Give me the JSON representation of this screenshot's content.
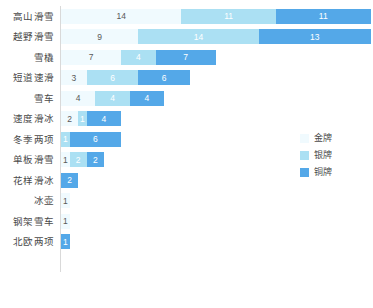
{
  "chart_data": {
    "type": "bar",
    "orientation": "horizontal",
    "stacked": true,
    "title": "",
    "subtitle": "",
    "xlabel": "",
    "ylabel": "",
    "grid": false,
    "xlim": [
      0,
      36
    ],
    "legend_position": "right",
    "categories": [
      "高山滑雪",
      "越野滑雪",
      "雪橇",
      "短道速滑",
      "雪车",
      "速度滑冰",
      "冬季两项",
      "单板滑雪",
      "花样滑冰",
      "冰壶",
      "钢架雪车",
      "北欧两项"
    ],
    "series": [
      {
        "name": "金牌",
        "color": "#f0fafe",
        "values": [
          14,
          9,
          7,
          3,
          4,
          2,
          0,
          1,
          0,
          1,
          1,
          0
        ]
      },
      {
        "name": "银牌",
        "color": "#abe0f3",
        "values": [
          11,
          14,
          4,
          6,
          4,
          1,
          1,
          2,
          0,
          0,
          0,
          0
        ]
      },
      {
        "name": "铜牌",
        "color": "#54a8e8",
        "values": [
          11,
          13,
          7,
          6,
          4,
          4,
          6,
          2,
          2,
          0,
          0,
          1
        ]
      }
    ]
  },
  "legend": {
    "items": [
      {
        "label": "金牌",
        "color": "#f0fafe"
      },
      {
        "label": "银牌",
        "color": "#abe0f3"
      },
      {
        "label": "铜牌",
        "color": "#54a8e8"
      }
    ]
  },
  "colors": {
    "gold": "#f0fafe",
    "silver": "#abe0f3",
    "bronze": "#54a8e8",
    "axis": "#d9d9d9",
    "label_text": "#4a4a4a",
    "background": "#ffffff"
  }
}
